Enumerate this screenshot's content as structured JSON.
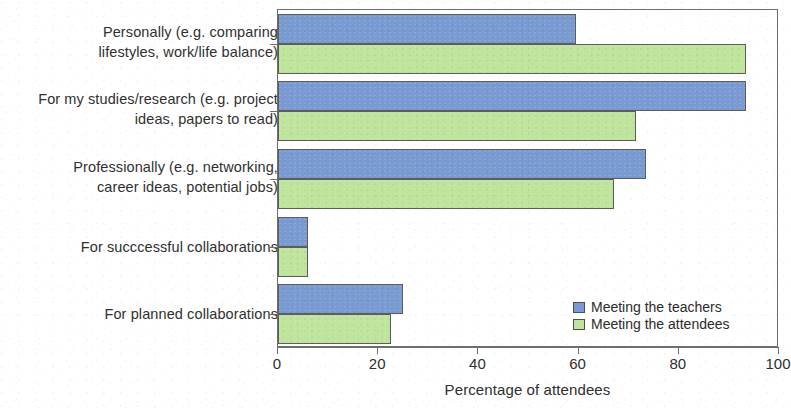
{
  "chart_data": {
    "type": "bar",
    "orientation": "horizontal",
    "title": "",
    "xlabel": "Percentage of attendees",
    "ylabel": "",
    "xlim": [
      0,
      100
    ],
    "xticks": [
      0,
      20,
      40,
      60,
      80,
      100
    ],
    "grid": false,
    "legend_position": "inside-bottom-right",
    "categories": [
      "Personally (e.g. comparing\nlifestyles, work/life balance)",
      "For my studies/research (e.g. project\nideas, papers to read)",
      "Professionally (e.g. networking,\ncareer ideas, potential jobs)",
      "For succcessful collaborations",
      "For planned collaborations"
    ],
    "series": [
      {
        "name": "Meeting the teachers",
        "color": "#7a9bd2",
        "values": [
          59.5,
          93.5,
          73.5,
          6.0,
          25.0
        ]
      },
      {
        "name": "Meeting the attendees",
        "color": "#bfe49c",
        "values": [
          93.5,
          71.5,
          67.0,
          6.0,
          22.5
        ]
      }
    ]
  },
  "axis": {
    "tick_labels": [
      "0",
      "20",
      "40",
      "60",
      "80",
      "100"
    ],
    "title": "Percentage of attendees"
  },
  "legend": {
    "items": [
      {
        "label": "Meeting the teachers",
        "color": "#7a9bd2"
      },
      {
        "label": "Meeting the attendees",
        "color": "#bfe49c"
      }
    ]
  },
  "colors": {
    "series_teachers": "#7a9bd2",
    "series_attendees": "#bfe49c",
    "axis": "#6e6e6e",
    "text": "#2b2b2b",
    "background": "#ffffff"
  }
}
